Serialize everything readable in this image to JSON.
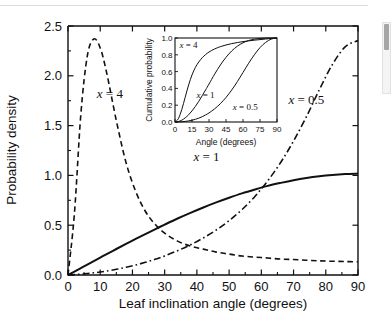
{
  "page": {
    "background_color": "#ffffff",
    "top_rule_color": "#dcdcdc"
  },
  "scrollbar": {
    "name": "vertical-scrollbar",
    "track_color": "#f4f4f4",
    "thumb_color": "#a6a6a6"
  },
  "chart_data": {
    "type": "line",
    "title": "",
    "subtitle": "",
    "xlabel": "Leaf inclination angle (degrees)",
    "ylabel": "Probability density",
    "xlim": [
      0,
      90
    ],
    "ylim": [
      0.0,
      2.5
    ],
    "xticks": [
      0,
      10,
      20,
      30,
      40,
      50,
      60,
      70,
      80,
      90
    ],
    "xticklabels": [
      "0",
      "10",
      "20",
      "30",
      "40",
      "50",
      "60",
      "70",
      "80",
      "90"
    ],
    "yticks": [
      0.0,
      0.5,
      1.0,
      1.5,
      2.0,
      2.5
    ],
    "yticklabels": [
      "0.0",
      "0.5",
      "1.0",
      "1.5",
      "2.0",
      "2.5"
    ],
    "grid": false,
    "legend_position": "inline-annotations",
    "x": [
      0,
      2,
      4,
      6,
      8,
      10,
      12,
      15,
      18,
      21,
      24,
      27,
      30,
      34,
      38,
      42,
      46,
      50,
      54,
      58,
      62,
      66,
      70,
      74,
      78,
      82,
      86,
      90
    ],
    "series": [
      {
        "name": "x = 4",
        "label": "x = 4",
        "linestyle": "dashed",
        "color": "#111111",
        "label_x": 13,
        "label_y": 1.78,
        "values": [
          0.0,
          0.62,
          1.62,
          2.2,
          2.37,
          2.28,
          2.03,
          1.55,
          1.13,
          0.84,
          0.64,
          0.51,
          0.42,
          0.34,
          0.29,
          0.26,
          0.23,
          0.21,
          0.19,
          0.18,
          0.17,
          0.16,
          0.155,
          0.148,
          0.142,
          0.138,
          0.135,
          0.133
        ]
      },
      {
        "name": "x = 1",
        "label": "x = 1",
        "linestyle": "solid",
        "color": "#111111",
        "label_x": 43,
        "label_y": 1.14,
        "values": [
          0.0,
          0.035,
          0.07,
          0.105,
          0.14,
          0.175,
          0.209,
          0.261,
          0.312,
          0.362,
          0.411,
          0.459,
          0.506,
          0.567,
          0.624,
          0.678,
          0.729,
          0.776,
          0.82,
          0.859,
          0.895,
          0.925,
          0.952,
          0.974,
          0.991,
          1.004,
          1.013,
          1.018
        ]
      },
      {
        "name": "x = 0.5",
        "label": "x = 0.5",
        "linestyle": "dashdot",
        "color": "#111111",
        "label_x": 74,
        "label_y": 1.72,
        "values": [
          0.0,
          0.004,
          0.009,
          0.015,
          0.022,
          0.03,
          0.04,
          0.057,
          0.077,
          0.1,
          0.127,
          0.157,
          0.192,
          0.244,
          0.303,
          0.372,
          0.452,
          0.546,
          0.657,
          0.789,
          0.946,
          1.13,
          1.345,
          1.59,
          1.86,
          2.11,
          2.29,
          2.355
        ]
      }
    ],
    "inset": {
      "type": "line",
      "title": "",
      "xlabel": "Angle (degrees)",
      "ylabel": "Cumulative probability",
      "xlim": [
        0,
        90
      ],
      "ylim": [
        0.0,
        1.0
      ],
      "xticks": [
        0,
        15,
        30,
        45,
        60,
        75,
        90
      ],
      "xticklabels": [
        "0",
        "15",
        "30",
        "45",
        "60",
        "75",
        "90"
      ],
      "yticks": [
        0.0,
        0.2,
        0.4,
        0.6,
        0.8,
        1.0
      ],
      "yticklabels": [
        "0.0",
        "0.2",
        "0.4",
        "0.6",
        "0.8",
        "1.0"
      ],
      "grid": false,
      "x": [
        0,
        3,
        6,
        9,
        12,
        15,
        18,
        21,
        24,
        27,
        30,
        35,
        40,
        45,
        50,
        55,
        60,
        65,
        70,
        75,
        80,
        85,
        90
      ],
      "series": [
        {
          "name": "x = 4",
          "label": "x = 4",
          "linestyle": "solid",
          "color": "#111111",
          "label_x": 12,
          "label_y": 0.88,
          "values": [
            0.0,
            0.04,
            0.15,
            0.295,
            0.44,
            0.56,
            0.65,
            0.715,
            0.765,
            0.803,
            0.833,
            0.87,
            0.897,
            0.917,
            0.933,
            0.946,
            0.957,
            0.966,
            0.974,
            0.981,
            0.988,
            0.994,
            1.0
          ]
        },
        {
          "name": "x = 1",
          "label": "x = 1",
          "linestyle": "solid",
          "color": "#111111",
          "label_x": 27,
          "label_y": 0.28,
          "values": [
            0.0,
            0.006,
            0.022,
            0.049,
            0.086,
            0.132,
            0.186,
            0.247,
            0.313,
            0.382,
            0.452,
            0.57,
            0.678,
            0.77,
            0.845,
            0.902,
            0.943,
            0.97,
            0.986,
            0.995,
            0.999,
            1.0,
            1.0
          ]
        },
        {
          "name": "x = 0.5",
          "label": "x = 0.5",
          "linestyle": "solid",
          "color": "#111111",
          "label_x": 62,
          "label_y": 0.14,
          "values": [
            0.0,
            0.001,
            0.003,
            0.007,
            0.013,
            0.021,
            0.032,
            0.046,
            0.063,
            0.084,
            0.108,
            0.157,
            0.218,
            0.292,
            0.38,
            0.48,
            0.59,
            0.7,
            0.8,
            0.886,
            0.948,
            0.987,
            1.0
          ]
        }
      ]
    }
  }
}
